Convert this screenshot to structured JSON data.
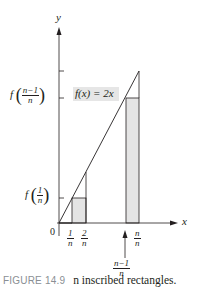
{
  "figure": {
    "axis_x_label": "x",
    "axis_y_label": "y",
    "origin_label": "0",
    "function_label": "f(x) = 2x",
    "y_tick_labels": {
      "f_n_minus_1_over_n": {
        "prefix": "f",
        "num": "n−1",
        "den": "n"
      },
      "f_1_over_n": {
        "prefix": "f",
        "num": "1",
        "den": "n"
      }
    },
    "x_tick_labels": [
      {
        "num": "1",
        "den": "n"
      },
      {
        "num": "2",
        "den": "n"
      },
      {
        "num": "n",
        "den": "n"
      }
    ],
    "arrow_label": {
      "num": "n−1",
      "den": "n"
    },
    "rect_fill": "#e4e4e4",
    "line_color": "#231f20",
    "label_bg": "#e6e6e6"
  },
  "caption": {
    "figure_number": "FIGURE 14.9",
    "text": "n inscribed rectangles."
  }
}
